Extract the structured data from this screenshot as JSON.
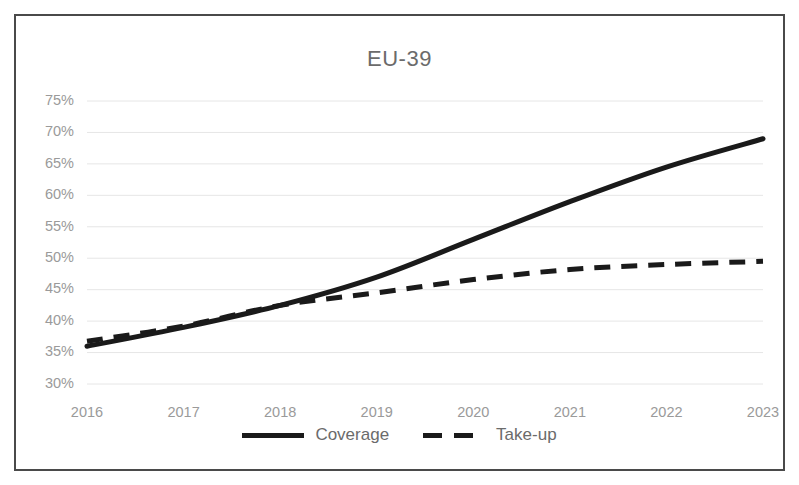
{
  "chart_data": {
    "type": "line",
    "title": "EU-39",
    "xlabel": "",
    "ylabel": "",
    "x": [
      2016,
      2017,
      2018,
      2019,
      2020,
      2021,
      2022,
      2023
    ],
    "categories": [
      "2016",
      "2017",
      "2018",
      "2019",
      "2020",
      "2021",
      "2022",
      "2023"
    ],
    "series": [
      {
        "name": "Coverage",
        "style": "solid",
        "color": "#1a1a1a",
        "values": [
          36.0,
          39.0,
          42.5,
          47.0,
          53.0,
          59.0,
          64.5,
          69.0
        ]
      },
      {
        "name": "Take-up",
        "style": "dashed",
        "color": "#1a1a1a",
        "values": [
          36.8,
          39.2,
          42.5,
          44.5,
          46.6,
          48.2,
          49.0,
          49.5
        ]
      }
    ],
    "ylim": [
      30,
      75
    ],
    "ytick_values": [
      75,
      70,
      65,
      60,
      55,
      50,
      45,
      40,
      35,
      30
    ],
    "ytick_labels": [
      "75%",
      "70%",
      "65%",
      "60%",
      "55%",
      "50%",
      "45%",
      "40%",
      "35%",
      "30%"
    ],
    "xtick_labels": [
      "2016",
      "2017",
      "2018",
      "2019",
      "2020",
      "2021",
      "2022",
      "2023"
    ],
    "grid": true,
    "grid_axis": "y",
    "legend": [
      "Coverage",
      "Take-up"
    ],
    "legend_position": "bottom",
    "axis_tick_color": "#9a9a9a",
    "gridline_color": "#e6e6e6",
    "border_color": "#4a4a4a",
    "title_color": "#6b6b6b"
  },
  "legend": {
    "coverage_label": "Coverage",
    "takeup_label": "Take-up"
  }
}
